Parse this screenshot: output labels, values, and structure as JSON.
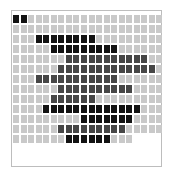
{
  "grid": {
    "columns": 20,
    "rows": 13,
    "cell_pitch_x": 7.55,
    "cell_pitch_y": 10,
    "colors": {
      "empty": "#c9c9c9",
      "black": "#121212",
      "dark": "#464646",
      "frame": "#bdbdbd"
    },
    "row_data": [
      {
        "length": 20,
        "fill": "black",
        "from": 1,
        "to": 2
      },
      {
        "length": 20,
        "fill": null,
        "from": 0,
        "to": -1
      },
      {
        "length": 20,
        "fill": "black",
        "from": 4,
        "to": 11
      },
      {
        "length": 20,
        "fill": "black",
        "from": 6,
        "to": 14
      },
      {
        "length": 20,
        "fill": "dark",
        "from": 8,
        "to": 18
      },
      {
        "length": 20,
        "fill": "dark",
        "from": 7,
        "to": 19
      },
      {
        "length": 20,
        "fill": "dark",
        "from": 4,
        "to": 14
      },
      {
        "length": 20,
        "fill": "dark",
        "from": 7,
        "to": 16
      },
      {
        "length": 20,
        "fill": "dark",
        "from": 6,
        "to": 11
      },
      {
        "length": 20,
        "fill": "black",
        "from": 5,
        "to": 17
      },
      {
        "length": 20,
        "fill": "black",
        "from": 10,
        "to": 16
      },
      {
        "length": 20,
        "fill": "dark",
        "from": 7,
        "to": 15
      },
      {
        "length": 16,
        "fill": "black",
        "from": 8,
        "to": 13
      }
    ]
  }
}
